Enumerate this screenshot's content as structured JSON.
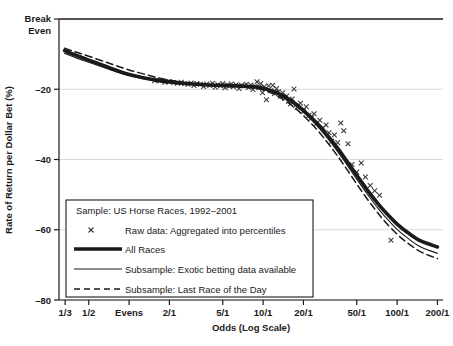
{
  "chart_data": {
    "type": "line",
    "title": "",
    "xlabel": "Odds (Log Scale)",
    "ylabel": "Rate of Return per Dollar Bet (%)",
    "xscale": "log",
    "xlim": [
      0.3,
      220
    ],
    "ylim": [
      -80,
      0
    ],
    "grid": true,
    "x_tick_labels": [
      "1/3",
      "1/2",
      "Evens",
      "2/1",
      "5/1",
      "10/1",
      "20/1",
      "50/1",
      "100/1",
      "200/1"
    ],
    "x_tick_values": [
      0.3333,
      0.5,
      1,
      2,
      5,
      10,
      20,
      50,
      100,
      200
    ],
    "y_tick_labels": [
      "Break Even",
      "-20",
      "-40",
      "-60",
      "-80"
    ],
    "y_tick_values": [
      0,
      -20,
      -40,
      -60,
      -80
    ],
    "break_even_line": 0,
    "legend_position": "lower-left-inside",
    "series": [
      {
        "name": "All Races",
        "style": "thick-solid",
        "color": "#1a1a1a",
        "x": [
          0.33,
          0.4,
          0.5,
          0.65,
          0.8,
          1.0,
          1.3,
          1.6,
          2.0,
          2.5,
          3.0,
          4.0,
          5.0,
          6.0,
          7.0,
          8.0,
          9.0,
          10.0,
          12.0,
          14.0,
          16.0,
          18.0,
          20.0,
          25.0,
          30.0,
          35.0,
          40.0,
          50.0,
          60.0,
          70.0,
          80.0,
          100.0,
          120.0,
          150.0,
          200.0
        ],
        "values": [
          -9.0,
          -10.3,
          -11.7,
          -13.3,
          -14.6,
          -15.8,
          -16.8,
          -17.4,
          -17.9,
          -18.3,
          -18.5,
          -18.8,
          -18.9,
          -19.0,
          -19.1,
          -19.2,
          -19.4,
          -19.7,
          -20.6,
          -21.8,
          -23.1,
          -24.5,
          -26.0,
          -29.5,
          -33.0,
          -36.2,
          -39.2,
          -44.5,
          -48.7,
          -52.0,
          -54.6,
          -58.4,
          -60.8,
          -63.2,
          -64.9
        ]
      },
      {
        "name": "Subsample: Exotic betting data available",
        "style": "thin-solid",
        "color": "#1a1a1a",
        "x": [
          0.33,
          0.4,
          0.5,
          0.65,
          0.8,
          1.0,
          1.3,
          1.6,
          2.0,
          2.5,
          3.0,
          4.0,
          5.0,
          6.0,
          7.0,
          8.0,
          9.0,
          10.0,
          12.0,
          14.0,
          16.0,
          18.0,
          20.0,
          25.0,
          30.0,
          35.0,
          40.0,
          50.0,
          60.0,
          70.0,
          80.0,
          100.0,
          120.0,
          150.0,
          200.0
        ],
        "values": [
          -9.8,
          -11.0,
          -12.3,
          -13.8,
          -15.0,
          -16.1,
          -17.0,
          -17.6,
          -18.0,
          -18.4,
          -18.6,
          -18.9,
          -19.0,
          -19.1,
          -19.2,
          -19.4,
          -19.6,
          -19.9,
          -20.9,
          -22.2,
          -23.6,
          -25.0,
          -26.6,
          -30.2,
          -33.8,
          -37.1,
          -40.2,
          -45.6,
          -49.9,
          -53.3,
          -56.0,
          -59.9,
          -62.4,
          -64.9,
          -66.7
        ]
      },
      {
        "name": "Subsample: Last Race of the Day",
        "style": "dashed",
        "color": "#1a1a1a",
        "x": [
          0.33,
          0.4,
          0.5,
          0.65,
          0.8,
          1.0,
          1.3,
          1.6,
          2.0,
          2.5,
          3.0,
          4.0,
          5.0,
          6.0,
          7.0,
          8.0,
          9.0,
          10.0,
          12.0,
          14.0,
          16.0,
          18.0,
          20.0,
          25.0,
          30.0,
          35.0,
          40.0,
          50.0,
          60.0,
          70.0,
          80.0,
          100.0,
          120.0,
          150.0,
          200.0
        ],
        "values": [
          -8.3,
          -9.4,
          -10.6,
          -12.1,
          -13.3,
          -14.5,
          -15.7,
          -16.6,
          -17.4,
          -18.0,
          -18.4,
          -18.8,
          -19.0,
          -19.1,
          -19.3,
          -19.5,
          -19.8,
          -20.2,
          -21.4,
          -22.8,
          -24.3,
          -25.9,
          -27.5,
          -31.3,
          -35.0,
          -38.4,
          -41.5,
          -47.0,
          -51.3,
          -54.7,
          -57.4,
          -61.3,
          -63.8,
          -66.3,
          -68.2
        ]
      }
    ],
    "scatter": {
      "name": "Raw data: Aggregated into percentiles",
      "marker": "x",
      "color": "#3a3a3a",
      "points": [
        [
          1.55,
          -17.6
        ],
        [
          1.7,
          -17.6
        ],
        [
          1.85,
          -18.0
        ],
        [
          2.0,
          -17.8
        ],
        [
          2.15,
          -18.1
        ],
        [
          2.3,
          -18.3
        ],
        [
          2.45,
          -18.0
        ],
        [
          2.6,
          -18.4
        ],
        [
          2.75,
          -18.6
        ],
        [
          2.9,
          -18.2
        ],
        [
          3.05,
          -18.9
        ],
        [
          3.2,
          -18.4
        ],
        [
          3.4,
          -18.6
        ],
        [
          3.6,
          -19.2
        ],
        [
          3.8,
          -18.5
        ],
        [
          4.0,
          -18.9
        ],
        [
          4.2,
          -18.3
        ],
        [
          4.4,
          -19.4
        ],
        [
          4.6,
          -18.7
        ],
        [
          4.8,
          -19.0
        ],
        [
          5.0,
          -18.4
        ],
        [
          5.2,
          -19.6
        ],
        [
          5.4,
          -18.8
        ],
        [
          5.6,
          -19.1
        ],
        [
          5.8,
          -18.5
        ],
        [
          6.0,
          -19.3
        ],
        [
          6.3,
          -18.7
        ],
        [
          6.6,
          -19.8
        ],
        [
          6.9,
          -18.9
        ],
        [
          7.2,
          -19.1
        ],
        [
          7.5,
          -18.6
        ],
        [
          7.8,
          -19.5
        ],
        [
          8.1,
          -18.8
        ],
        [
          8.4,
          -20.1
        ],
        [
          8.7,
          -19.2
        ],
        [
          9.0,
          -17.9
        ],
        [
          9.3,
          -19.6
        ],
        [
          9.6,
          -18.4
        ],
        [
          9.9,
          -21.0
        ],
        [
          10.2,
          -19.3
        ],
        [
          10.6,
          -23.0
        ],
        [
          11.0,
          -19.0
        ],
        [
          11.4,
          -20.4
        ],
        [
          11.8,
          -18.9
        ],
        [
          12.2,
          -21.2
        ],
        [
          12.6,
          -19.8
        ],
        [
          13.0,
          -20.7
        ],
        [
          13.5,
          -22.0
        ],
        [
          14.0,
          -21.0
        ],
        [
          14.5,
          -22.6
        ],
        [
          15.0,
          -21.9
        ],
        [
          15.5,
          -23.4
        ],
        [
          16.0,
          -24.2
        ],
        [
          16.5,
          -22.8
        ],
        [
          17.0,
          -19.9
        ],
        [
          17.5,
          -24.6
        ],
        [
          18.0,
          -25.2
        ],
        [
          19.0,
          -24.0
        ],
        [
          20.0,
          -26.3
        ],
        [
          21.0,
          -25.0
        ],
        [
          22.0,
          -27.4
        ],
        [
          23.0,
          -28.2
        ],
        [
          24.0,
          -27.0
        ],
        [
          25.0,
          -29.8
        ],
        [
          26.5,
          -28.8
        ],
        [
          28.0,
          -31.0
        ],
        [
          29.5,
          -30.2
        ],
        [
          31.0,
          -32.4
        ],
        [
          32.5,
          -34.8
        ],
        [
          34.0,
          -33.0
        ],
        [
          36.0,
          -35.2
        ],
        [
          38.0,
          -29.6
        ],
        [
          40.0,
          -31.8
        ],
        [
          43.0,
          -35.5
        ],
        [
          46.0,
          -41.4
        ],
        [
          50.0,
          -43.6
        ],
        [
          54.0,
          -41.0
        ],
        [
          58.0,
          -45.0
        ],
        [
          63.0,
          -47.4
        ],
        [
          68.0,
          -48.9
        ],
        [
          74.0,
          -50.2
        ],
        [
          90.0,
          -63.0
        ]
      ]
    }
  },
  "legend": {
    "sample_label": "Sample: US Horse Races, 1992–2001",
    "entries": [
      {
        "marker": "x",
        "label": "Raw data: Aggregated into percentiles"
      },
      {
        "marker": "thick-line",
        "label": "All Races"
      },
      {
        "marker": "thin-line",
        "label": "Subsample: Exotic betting data available"
      },
      {
        "marker": "dashed-line",
        "label": "Subsample: Last Race of the Day"
      }
    ]
  },
  "axes": {
    "y_title": "Rate of Return per Dollar Bet (%)",
    "x_title": "Odds (Log Scale)",
    "y_labels": {
      "break_even_line1": "Break",
      "break_even_line2": "Even",
      "t20": "–20",
      "t40": "–40",
      "t60": "–60",
      "t80": "–80"
    },
    "x_labels": {
      "x0": "1/3",
      "x1": "1/2",
      "x2": "Evens",
      "x3": "2/1",
      "x4": "5/1",
      "x5": "10/1",
      "x6": "20/1",
      "x7": "50/1",
      "x8": "100/1",
      "x9": "200/1"
    }
  },
  "colors": {
    "ink": "#1a1a1a",
    "grid": "#c9c9c9",
    "marker": "#3a3a3a",
    "background": "#ffffff"
  }
}
